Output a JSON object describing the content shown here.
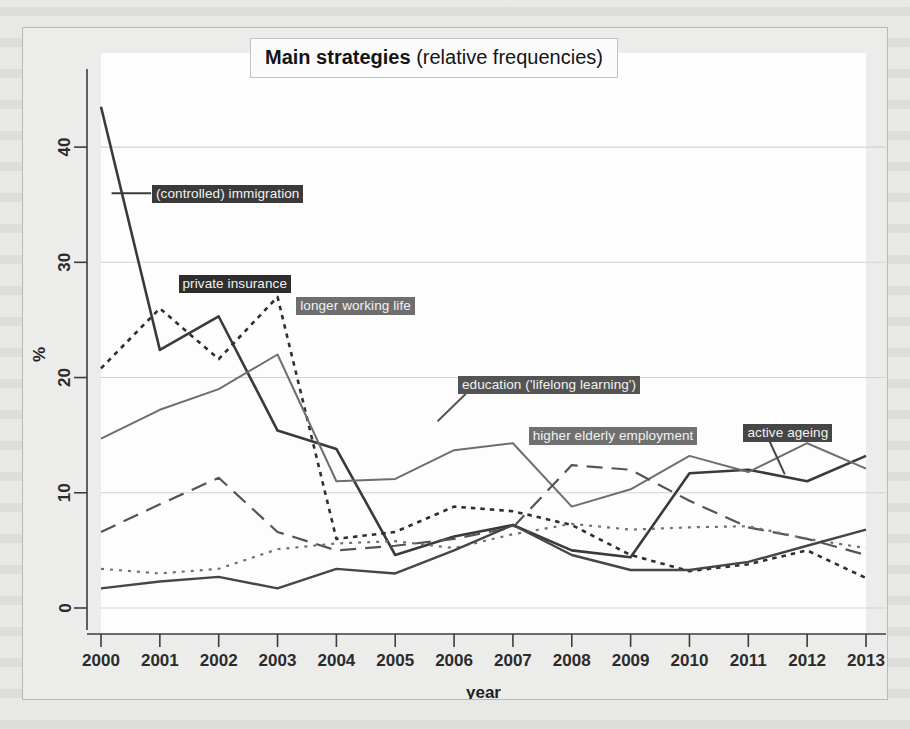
{
  "figure": {
    "title_strong": "Main strategies",
    "title_rest": " (relative frequencies)"
  },
  "chart_data": {
    "type": "line",
    "title": "Main strategies (relative frequencies)",
    "xlabel": "year",
    "ylabel": "%",
    "x": [
      2000,
      2001,
      2002,
      2003,
      2004,
      2005,
      2006,
      2007,
      2008,
      2009,
      2010,
      2011,
      2012,
      2013
    ],
    "categories": [
      "2000",
      "2001",
      "2002",
      "2003",
      "2004",
      "2005",
      "2006",
      "2007",
      "2008",
      "2009",
      "2010",
      "2011",
      "2012",
      "2013"
    ],
    "xlim": [
      2000,
      2013
    ],
    "ylim": [
      0,
      44
    ],
    "yticks": [
      0,
      10,
      20,
      30,
      40
    ],
    "xticks": [
      "2000",
      "2001",
      "2002",
      "2003",
      "2004",
      "2005",
      "2006",
      "2007",
      "2008",
      "2009",
      "2010",
      "2011",
      "2012",
      "2013"
    ],
    "grid": "horizontal",
    "legend": "inline-labels",
    "series": [
      {
        "name": "(controlled) immigration",
        "style": "solid",
        "width": 2.6,
        "color": "#3a3a3a",
        "label_x": 2000.85,
        "label_y": 36.0,
        "values": [
          43.5,
          22.4,
          25.3,
          15.4,
          13.8,
          4.6,
          6.2,
          7.2,
          5.0,
          4.4,
          11.7,
          12.0,
          11.0,
          13.2
        ]
      },
      {
        "name": "private insurance",
        "style": "dotted-coarse",
        "width": 2.6,
        "color": "#2e2e2e",
        "label_x": 2001.3,
        "label_y": 28.2,
        "values": [
          20.8,
          26.0,
          21.6,
          27.0,
          6.0,
          6.6,
          8.8,
          8.4,
          7.2,
          4.6,
          3.2,
          3.8,
          5.0,
          2.6
        ]
      },
      {
        "name": "longer working life",
        "style": "solid",
        "width": 2.0,
        "color": "#6e6e6e",
        "label_x": 2003.3,
        "label_y": 26.3,
        "values": [
          14.7,
          17.2,
          19.0,
          22.0,
          11.0,
          11.2,
          13.7,
          14.3,
          8.8,
          10.3,
          13.2,
          11.8,
          14.3,
          12.1
        ]
      },
      {
        "name": "education ('lifelong learning')",
        "style": "dashed",
        "width": 2.2,
        "color": "#545454",
        "label_x": 2006.05,
        "label_y": 19.4,
        "values": [
          6.6,
          9.0,
          11.3,
          6.6,
          5.0,
          5.4,
          6.0,
          7.0,
          12.4,
          12.0,
          9.3,
          7.0,
          6.0,
          4.6
        ]
      },
      {
        "name": "higher elderly employment",
        "style": "dotted-fine",
        "width": 2.2,
        "color": "#707070",
        "label_x": 2007.25,
        "label_y": 15.0,
        "values": [
          3.4,
          3.0,
          3.4,
          5.1,
          5.6,
          5.8,
          5.2,
          6.4,
          7.3,
          6.8,
          7.0,
          7.1,
          6.0,
          5.2
        ]
      },
      {
        "name": "active ageing",
        "style": "solid",
        "width": 2.4,
        "color": "#464646",
        "label_x": 2010.9,
        "label_y": 15.3,
        "values": [
          1.7,
          2.3,
          2.7,
          1.7,
          3.4,
          3.0,
          5.0,
          7.2,
          4.6,
          3.3,
          3.3,
          4.0,
          5.4,
          6.8
        ]
      }
    ]
  }
}
